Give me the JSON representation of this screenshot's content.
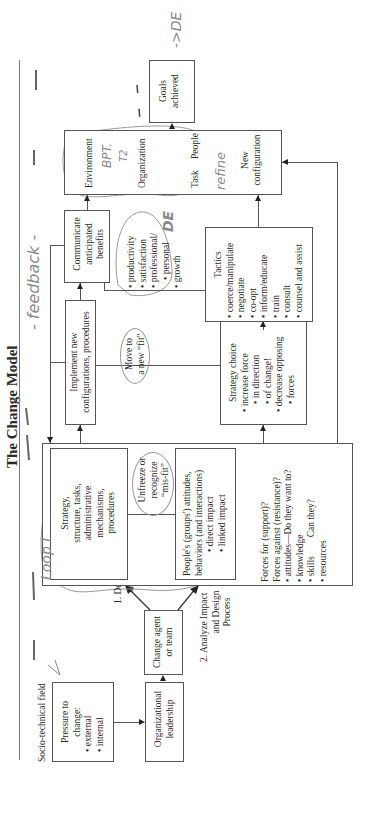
{
  "title": "The Change Model",
  "field_label": "Socio-technical field",
  "boxes": {
    "pressure": {
      "title": "Pressure to",
      "title2": "change:",
      "items": [
        "external",
        "internal"
      ]
    },
    "leadership": {
      "line1": "Organizational",
      "line2": "leadership"
    },
    "change_agent": {
      "line1": "Change agent",
      "line2": "or team"
    },
    "strategy": {
      "lines": [
        "Strategy,",
        "structure, tasks,",
        "administrative",
        "mechanisms,",
        "procedures"
      ]
    },
    "unfreeze": {
      "lines": [
        "Unfreeze or",
        "recognize",
        "“mis-fit”"
      ]
    },
    "people": {
      "line1": "People's (groups') attitudes,",
      "line2": "behaviors (and interactions)",
      "items": [
        "direct impact",
        "linked impact"
      ]
    },
    "forces": {
      "line1": "Forces for (support)?",
      "line2": "Forces against (resistance)?",
      "items": [
        "attitudes—Do they want to?",
        "knowledge",
        "skills        Can they?",
        "resources"
      ]
    },
    "implement": {
      "line1": "Implement new",
      "line2": "configurations, procedures"
    },
    "move_fit": {
      "line1": "Move to",
      "line2": "a new “fit”"
    },
    "strategy_choice": {
      "title": "Strategy choice",
      "items": [
        "increase force",
        "in direction",
        "of change!",
        "decrease opposing",
        "forces"
      ]
    },
    "communicate": {
      "line1": "Communicate",
      "line2": "anticipated",
      "line3": "benefits"
    },
    "benefits": {
      "items": [
        "productivity",
        "satisfaction",
        "professional/",
        "personal",
        "growth"
      ]
    },
    "tactics": {
      "title": "Tactics",
      "items": [
        "coerce/manipulate",
        "negotiate",
        "co-opt",
        "inform/educate",
        "train",
        "consult",
        "counsel and assist"
      ]
    },
    "environment": {
      "env": "Environment",
      "org": "Organization",
      "task": "Task",
      "people": "People"
    },
    "new_config": {
      "line1": "New",
      "line2": "configuration"
    },
    "goals": {
      "line1": "Goals",
      "line2": "achieved"
    }
  },
  "edge_labels": {
    "design": {
      "line1": "1. Design",
      "line2": "change"
    },
    "analyze": {
      "line1": "2. Analyze Impact",
      "line2": "and Design",
      "line3": "Process"
    }
  },
  "handwritten": {
    "feedback": "- feedback -",
    "goals_note": "->DE",
    "bpt": "BPT.",
    "bpt_sub": "T2",
    "refine": "refine",
    "de": "DE",
    "loop_note": "Loop I"
  }
}
